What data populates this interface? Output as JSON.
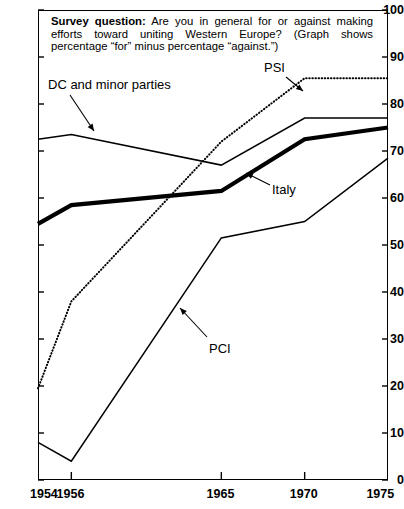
{
  "chart_data": {
    "type": "line",
    "title_lead": "Survey question:",
    "title_rest": " Are you in general for or against making efforts toward uniting Western Europe? (Graph shows percentage “for” minus percentage “against.”)",
    "xlabel": "",
    "ylabel": "",
    "x": [
      1954,
      1956,
      1965,
      1970,
      1975
    ],
    "xtick_labels": [
      "1954",
      "1956",
      "1965",
      "1970",
      "1975"
    ],
    "ytick_labels": [
      "0",
      "10",
      "20",
      "30",
      "40",
      "50",
      "60",
      "70",
      "80",
      "90",
      "100"
    ],
    "ylim": [
      0,
      100
    ],
    "xlim": [
      1954,
      1975
    ],
    "grid": false,
    "legend_position": "inline-annotations",
    "series": [
      {
        "name": "DC and minor parties",
        "style": "solid-thin",
        "color": "#000000",
        "values": [
          72.5,
          73.5,
          67.0,
          77.0,
          77.0
        ]
      },
      {
        "name": "Italy",
        "style": "solid-thick",
        "color": "#000000",
        "values": [
          54.5,
          58.5,
          61.5,
          72.5,
          75.0
        ]
      },
      {
        "name": "PSI",
        "style": "dotted",
        "color": "#000000",
        "values": [
          19.5,
          38.0,
          72.0,
          85.5,
          85.5
        ]
      },
      {
        "name": "PCI",
        "style": "solid-thin",
        "color": "#000000",
        "values": [
          8.0,
          4.0,
          51.5,
          55.0,
          68.5
        ]
      }
    ],
    "annotations": [
      {
        "label": "DC and minor parties",
        "points_to_series": "DC and minor parties"
      },
      {
        "label": "PSI",
        "points_to_series": "PSI"
      },
      {
        "label": "Italy",
        "points_to_series": "Italy"
      },
      {
        "label": "PCI",
        "points_to_series": "PCI"
      }
    ]
  }
}
